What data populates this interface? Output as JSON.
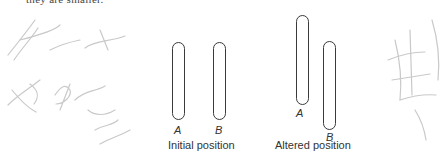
{
  "top_text": "they are smaller.",
  "diagram": {
    "initial": {
      "caption": "Initial position",
      "rods": [
        {
          "label": "A"
        },
        {
          "label": "B"
        }
      ]
    },
    "altered": {
      "caption": "Altered position",
      "rods": [
        {
          "label": "A"
        },
        {
          "label": "B"
        }
      ]
    }
  },
  "colors": {
    "rod_stroke": "#3a3a3a",
    "scribble": "#c8c8c8"
  }
}
